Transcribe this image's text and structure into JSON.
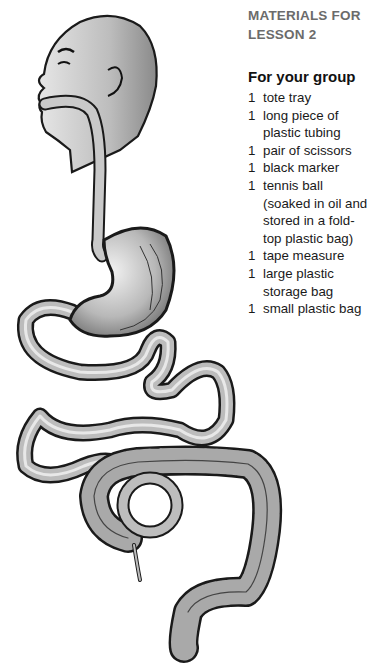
{
  "materials": {
    "heading_line1": "MATERIALS FOR",
    "heading_line2": "LESSON 2",
    "subheading": "For your group",
    "items": [
      {
        "qty": "1",
        "desc": "tote tray"
      },
      {
        "qty": "1",
        "desc": "long piece of plastic tubing"
      },
      {
        "qty": "1",
        "desc": "pair of scissors"
      },
      {
        "qty": "1",
        "desc": "black marker"
      },
      {
        "qty": "1",
        "desc": "tennis ball (soaked in oil and stored in a fold-top plastic bag)"
      },
      {
        "qty": "1",
        "desc": "tape measure"
      },
      {
        "qty": "1",
        "desc": "large plastic storage bag"
      },
      {
        "qty": "1",
        "desc": "small plastic bag"
      }
    ]
  },
  "illustration": {
    "subject": "human digestive tract",
    "parts": [
      "head",
      "esophagus",
      "stomach",
      "small intestine",
      "large intestine",
      "appendix",
      "rectum"
    ]
  }
}
